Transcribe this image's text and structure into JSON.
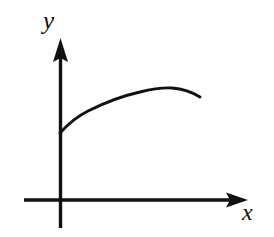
{
  "figure": {
    "background_color": "#ffffff",
    "ink_color": "#111111",
    "width": 274,
    "height": 237
  },
  "axes": {
    "origin": {
      "x": 60,
      "y": 200
    },
    "x_axis": {
      "label": "x",
      "name": "x-axis",
      "start": {
        "x": 24,
        "y": 200
      },
      "end": {
        "x": 248,
        "y": 200
      },
      "arrow": "right",
      "label_position": {
        "x": 242,
        "y": 200
      }
    },
    "y_axis": {
      "label": "y",
      "name": "y-axis",
      "start": {
        "x": 60,
        "y": 228
      },
      "end": {
        "x": 60,
        "y": 38
      },
      "arrow": "up",
      "label_position": {
        "x": 43,
        "y": 8
      }
    }
  },
  "chart_data": {
    "type": "line",
    "title": "",
    "xlabel": "x",
    "ylabel": "y",
    "grid": false,
    "legend": null,
    "axis_arrows": true,
    "curve_points_px": [
      {
        "x": 60,
        "y": 133
      },
      {
        "x": 67,
        "y": 126
      },
      {
        "x": 75,
        "y": 120
      },
      {
        "x": 85,
        "y": 114
      },
      {
        "x": 96,
        "y": 108
      },
      {
        "x": 110,
        "y": 102
      },
      {
        "x": 125,
        "y": 97
      },
      {
        "x": 140,
        "y": 93
      },
      {
        "x": 152,
        "y": 90
      },
      {
        "x": 165,
        "y": 88
      },
      {
        "x": 175,
        "y": 88
      },
      {
        "x": 185,
        "y": 90
      },
      {
        "x": 194,
        "y": 93
      },
      {
        "x": 200,
        "y": 97
      }
    ],
    "curve_path": "M 60 133 C 68 124, 76 117, 88 111 C 104 103, 122 96, 140 92 C 152 89, 162 87.5, 172 88 C 182 88.8, 192 92, 200 97",
    "x": [
      0.0,
      0.04,
      0.08,
      0.13,
      0.19,
      0.27,
      0.35,
      0.43,
      0.49,
      0.56,
      0.61,
      0.66,
      0.71,
      0.74
    ],
    "y": [
      0.42,
      0.46,
      0.49,
      0.53,
      0.57,
      0.6,
      0.64,
      0.66,
      0.68,
      0.69,
      0.69,
      0.68,
      0.66,
      0.64
    ],
    "xlim": [
      -0.22,
      1.16
    ],
    "ylim": [
      -0.17,
      1.0
    ],
    "start_point": {
      "x": 0.0,
      "y": 0.42
    },
    "peak_point": {
      "x": 0.61,
      "y": 0.69
    },
    "end_point": {
      "x": 0.74,
      "y": 0.64
    }
  }
}
